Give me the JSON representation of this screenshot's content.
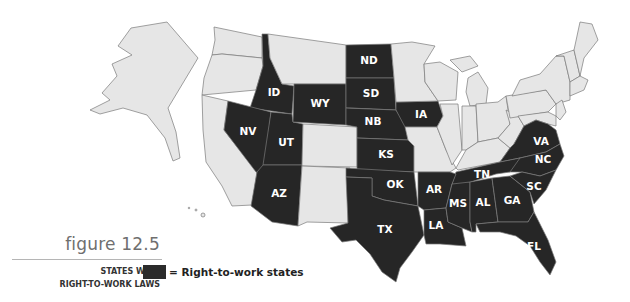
{
  "figure": {
    "number_label": "figure 12.5",
    "title_line1": "STATES WITH",
    "title_line2": "RIGHT-TO-WORK LAWS"
  },
  "legend": {
    "label": "= Right-to-work states",
    "swatch_color": "#2b2b2b"
  },
  "colors": {
    "right_to_work": "#262626",
    "other": "#e6e6e6",
    "border": "#7a7a7a"
  },
  "map": {
    "right_to_work_states": [
      "ID",
      "NV",
      "UT",
      "AZ",
      "WY",
      "ND",
      "SD",
      "NB",
      "KS",
      "OK",
      "TX",
      "IA",
      "AR",
      "LA",
      "MS",
      "AL",
      "TN",
      "GA",
      "FL",
      "SC",
      "NC",
      "VA"
    ],
    "labels": {
      "ID": "ID",
      "NV": "NV",
      "UT": "UT",
      "AZ": "AZ",
      "WY": "WY",
      "ND": "ND",
      "SD": "SD",
      "NB": "NB",
      "KS": "KS",
      "OK": "OK",
      "TX": "TX",
      "IA": "IA",
      "AR": "AR",
      "LA": "LA",
      "MS": "MS",
      "AL": "AL",
      "TN": "TN",
      "GA": "GA",
      "FL": "FL",
      "SC": "SC",
      "NC": "NC",
      "VA": "VA"
    }
  }
}
